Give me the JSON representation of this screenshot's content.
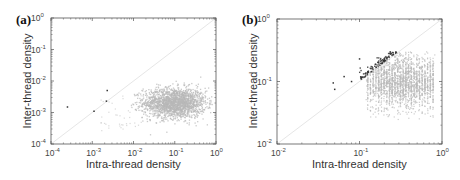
{
  "chart_data": [
    {
      "panel": "(a)",
      "type": "scatter",
      "title": "",
      "xlabel": "Intra-thread density",
      "ylabel": "Inter-thread density",
      "xscale": "log",
      "yscale": "log",
      "xlim": [
        0.0001,
        1
      ],
      "ylim": [
        0.0001,
        1
      ],
      "xticks": [
        "10^-4",
        "10^-3",
        "10^-2",
        "10^-1",
        "10^0"
      ],
      "yticks": [
        "10^-4",
        "10^-3",
        "10^-2",
        "10^-1",
        "10^0"
      ],
      "grid": false,
      "legend": null,
      "diagonal_reference_line": true,
      "series": [
        {
          "name": "main cluster (gray)",
          "color": "#b8b8b8",
          "description": "dense cloud centered near x≈0.1, y≈0.002; x spans ≈0.01–0.8, y spans ≈0.0002–0.012",
          "center": [
            0.1,
            0.002
          ],
          "x_range": [
            0.01,
            0.8
          ],
          "y_range": [
            0.0002,
            0.012
          ]
        },
        {
          "name": "outliers (dark)",
          "color": "#333333",
          "points": [
            [
              0.00025,
              0.0015
            ],
            [
              0.0011,
              0.0011
            ],
            [
              0.0023,
              0.005
            ],
            [
              0.0022,
              0.0023
            ]
          ]
        }
      ]
    },
    {
      "panel": "(b)",
      "type": "scatter",
      "title": "",
      "xlabel": "Intra-thread density",
      "ylabel": "Inter-thread density",
      "xscale": "log",
      "yscale": "log",
      "xlim": [
        0.01,
        1
      ],
      "ylim": [
        0.01,
        1
      ],
      "xticks": [
        "10^-2",
        "10^-1",
        "10^0"
      ],
      "yticks": [
        "10^-2",
        "10^-1",
        "10^0"
      ],
      "grid": false,
      "legend": null,
      "diagonal_reference_line": true,
      "series": [
        {
          "name": "main cluster (gray)",
          "color": "#b8b8b8",
          "description": "cloud with vertical striping; x spans ≈0.12–0.8, y spans ≈0.025–0.3, densest near x≈0.3, y≈0.1",
          "center": [
            0.3,
            0.1
          ],
          "x_range": [
            0.12,
            0.8
          ],
          "y_range": [
            0.025,
            0.3
          ]
        },
        {
          "name": "above-diagonal band (dark)",
          "color": "#333333",
          "description": "dark points lying just above the diagonal, x≈0.1–0.28, y≈0.1–0.28",
          "x_range": [
            0.1,
            0.28
          ],
          "y_range": [
            0.1,
            0.28
          ],
          "points": [
            [
              0.048,
              0.095
            ],
            [
              0.05,
              0.075
            ],
            [
              0.065,
              0.12
            ],
            [
              0.08,
              0.1
            ],
            [
              0.1,
              0.23
            ]
          ]
        }
      ]
    }
  ],
  "panels": {
    "a": {
      "label": "(a)",
      "xlabel": "Intra-thread density",
      "ylabel": "Inter-thread density",
      "xmin_exp": -4,
      "xmax_exp": 0,
      "ymin_exp": -4,
      "ymax_exp": 0,
      "frame": {
        "x": 51,
        "y": 18,
        "w": 165,
        "h": 126
      }
    },
    "b": {
      "label": "(b)",
      "xlabel": "Intra-thread density",
      "ylabel": "Inter-thread density",
      "xmin_exp": -2,
      "xmax_exp": 0,
      "ymin_exp": -2,
      "ymax_exp": 0,
      "frame": {
        "x": 51,
        "y": 19,
        "w": 165,
        "h": 125
      }
    }
  },
  "colors": {
    "gray_points": "#b8b8b8",
    "dark_points": "#333333",
    "axis": "#555555",
    "diagonal": "#e6e6e6"
  }
}
